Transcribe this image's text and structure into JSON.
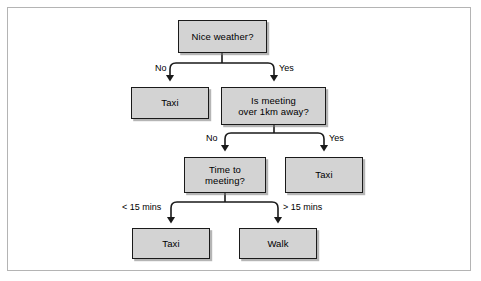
{
  "figure": {
    "background_color": "#ffffff",
    "frame_color": "#b4b4b4",
    "node_fill": "#d3d3d3",
    "node_border": "#1a1a1a",
    "connector_color": "#1a1a1a"
  },
  "nodes": {
    "root": {
      "line1": "Nice weather?"
    },
    "taxi_no_weather": {
      "line1": "Taxi"
    },
    "distance": {
      "line1": "Is meeting",
      "line2": "over 1km away?"
    },
    "time": {
      "line1": "Time to",
      "line2": "meeting?"
    },
    "taxi_far": {
      "line1": "Taxi"
    },
    "taxi_short_time": {
      "line1": "Taxi"
    },
    "walk": {
      "line1": "Walk"
    }
  },
  "edge_labels": {
    "weather_no": "No",
    "weather_yes": "Yes",
    "distance_no": "No",
    "distance_yes": "Yes",
    "time_less": "< 15 mins",
    "time_more": "> 15 mins"
  }
}
